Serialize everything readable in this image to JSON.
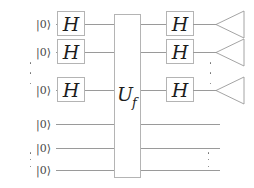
{
  "diagram": {
    "colors": {
      "wire": "#9a9a9a",
      "gate_border": "#b4b4b4",
      "gate_text": "#1d1d1d",
      "ket_text": "#4a4a4a",
      "dots": "#6f6f6f",
      "background": "#ffffff"
    }
  },
  "registers": {
    "top": {
      "name": "input-register",
      "qubits": [
        {
          "ket": "|0⟩",
          "y": 70,
          "has_hadamard_in": true,
          "has_hadamard_out": true,
          "has_detector": true
        },
        {
          "ket": "|0⟩",
          "y": 52,
          "has_hadamard_in": true,
          "has_hadamard_out": true,
          "has_detector": true
        },
        {
          "ket": "|0⟩",
          "y": 90,
          "has_hadamard_in": true,
          "has_hadamard_out": true,
          "has_detector": true
        }
      ]
    },
    "bottom": {
      "name": "ancilla-register",
      "qubits": [
        {
          "ket": "|0⟩",
          "y": 124,
          "has_hadamard_in": false,
          "has_hadamard_out": false,
          "has_detector": false
        },
        {
          "ket": "|0⟩",
          "y": 148,
          "has_hadamard_in": false,
          "has_hadamard_out": false,
          "has_detector": false
        },
        {
          "ket": "|0⟩",
          "y": 170,
          "has_hadamard_in": false,
          "has_hadamard_out": false,
          "has_detector": false
        }
      ]
    }
  },
  "rows": {
    "top_wire_y": [
      24,
      52,
      90
    ],
    "bottom_wire_y": [
      124,
      148,
      170
    ]
  },
  "gates": {
    "hadamard_label": "H",
    "oracle_label": "U",
    "oracle_subscript": "f"
  },
  "ellipses": {
    "left_register_dots": "⋮",
    "right_register_dots": "⋮",
    "bottom_left_dots": "⋮",
    "bottom_right_dots": "⋮"
  },
  "detectors": {
    "symbol_name": "measurement-detector",
    "count": 3
  }
}
